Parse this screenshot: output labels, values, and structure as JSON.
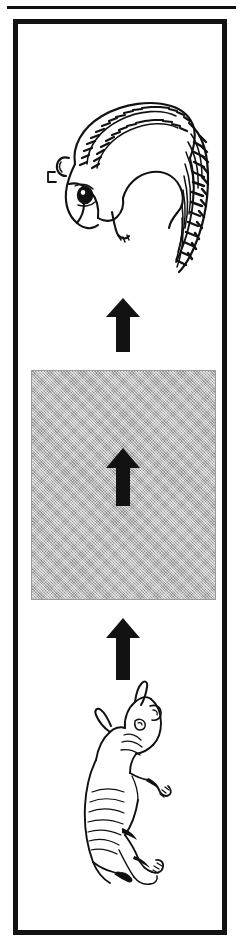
{
  "figure": {
    "kind": "scale-progression-diagram",
    "orientation": "vertical",
    "direction": "upward",
    "background_color": "#ffffff",
    "ink_color": "#121212",
    "frame": {
      "name": "outer-frame",
      "border_color": "#121212",
      "border_width_px": 5,
      "has_top_hairline": true
    },
    "panels": [
      {
        "index": 0,
        "name": "chipmunk-panel",
        "type": "illustration",
        "subject": "chipmunk",
        "subject_icon": "chipmunk-icon",
        "position": "top",
        "fill": "#ffffff"
      },
      {
        "index": 1,
        "name": "upper-arrow",
        "type": "arrow",
        "subject_icon": "arrow-up-icon",
        "color": "#121212",
        "direction": "up"
      },
      {
        "index": 2,
        "name": "grey-block-panel",
        "type": "shaded-rectangle",
        "fill": "#b2b2b2",
        "stroke": "#9a9a9a",
        "contains_arrow": true,
        "inner_arrow_icon": "arrow-up-icon"
      },
      {
        "index": 3,
        "name": "lower-arrow",
        "type": "arrow",
        "subject_icon": "arrow-up-icon",
        "color": "#121212",
        "direction": "up"
      },
      {
        "index": 4,
        "name": "rhinoceros-panel",
        "type": "illustration",
        "subject": "rhinoceros",
        "subject_icon": "rhinoceros-icon",
        "position": "bottom",
        "fill": "#ffffff"
      }
    ],
    "arrow_count": 3,
    "labels": []
  }
}
